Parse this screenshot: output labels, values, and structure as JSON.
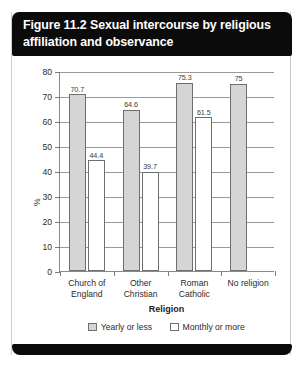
{
  "figure": {
    "title": "Figure 11.2 Sexual intercourse by religious affiliation and observance"
  },
  "chart_data": {
    "type": "bar",
    "title": "Figure 11.2 Sexual intercourse by religious affiliation and observance",
    "xlabel": "Religion",
    "ylabel": "%",
    "ylim": [
      0,
      80
    ],
    "ytick_step": 10,
    "yticks": [
      "0",
      "10",
      "20",
      "30",
      "40",
      "50",
      "60",
      "70",
      "80"
    ],
    "grid": true,
    "legend_position": "bottom",
    "categories": [
      "Church of England",
      "Other Christian",
      "Roman Catholic",
      "No religion"
    ],
    "category_lines": [
      [
        "Church of",
        "England"
      ],
      [
        "Other",
        "Christian"
      ],
      [
        "Roman",
        "Catholic"
      ],
      [
        "No religion"
      ]
    ],
    "series": [
      {
        "name": "Yearly or less",
        "color": "#d5d5d5",
        "values": [
          70.7,
          64.6,
          75.3,
          75
        ],
        "labels": [
          "70.7",
          "64.6",
          "75.3",
          "75"
        ]
      },
      {
        "name": "Monthly or more",
        "color": "#ffffff",
        "values": [
          44.4,
          39.7,
          61.5,
          null
        ],
        "labels": [
          "44.4",
          "39.7",
          "61.5",
          ""
        ]
      }
    ]
  }
}
